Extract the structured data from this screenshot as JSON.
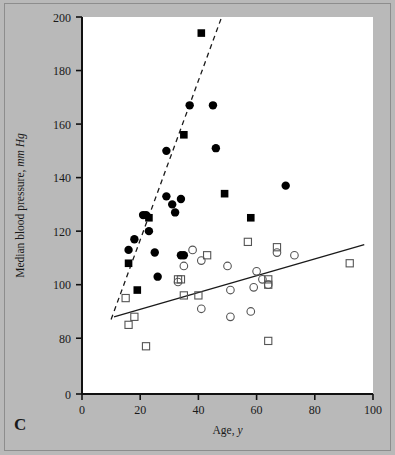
{
  "figure": {
    "panel_label": "C",
    "background_color": "#b9b9b9",
    "plot_background_color": "#ffffff"
  },
  "chart_data": {
    "type": "scatter",
    "title": "",
    "xlabel_plain": "Age, ",
    "xlabel_italic": "y",
    "ylabel_plain": "Median blood pressure, ",
    "ylabel_italic": "mm Hg",
    "xlim": [
      0,
      100
    ],
    "ylim": [
      70,
      200
    ],
    "xticks": [
      0,
      20,
      40,
      60,
      80,
      100
    ],
    "yticks": [
      0,
      80,
      100,
      120,
      140,
      160,
      180,
      200
    ],
    "ytick_labels": [
      "0",
      "80",
      "100",
      "120",
      "140",
      "160",
      "180",
      "200"
    ],
    "y_axis_break": true,
    "grid": false,
    "legend_position": "none",
    "series": [
      {
        "name": "filled-circle",
        "marker": "filled-circle",
        "color": "#000000",
        "points": [
          [
            16,
            113
          ],
          [
            18,
            117
          ],
          [
            21,
            126
          ],
          [
            22,
            126
          ],
          [
            23,
            120
          ],
          [
            25,
            112
          ],
          [
            29,
            150
          ],
          [
            29,
            133
          ],
          [
            31,
            130
          ],
          [
            32,
            127
          ],
          [
            34,
            132
          ],
          [
            34,
            111
          ],
          [
            35,
            111
          ],
          [
            37,
            167
          ],
          [
            45,
            167
          ],
          [
            46,
            151
          ],
          [
            26,
            103
          ],
          [
            70,
            137
          ]
        ]
      },
      {
        "name": "filled-square",
        "marker": "filled-square",
        "color": "#000000",
        "points": [
          [
            16,
            108
          ],
          [
            19,
            98
          ],
          [
            23,
            125
          ],
          [
            35,
            156
          ],
          [
            41,
            194
          ],
          [
            49,
            134
          ],
          [
            58,
            125
          ]
        ]
      },
      {
        "name": "open-circle",
        "marker": "open-circle",
        "color": "#555555",
        "points": [
          [
            33,
            101
          ],
          [
            35,
            107
          ],
          [
            38,
            113
          ],
          [
            41,
            109
          ],
          [
            41,
            91
          ],
          [
            50,
            107
          ],
          [
            51,
            98
          ],
          [
            51,
            88
          ],
          [
            58,
            90
          ],
          [
            59,
            99
          ],
          [
            60,
            105
          ],
          [
            64,
            100
          ],
          [
            67,
            112
          ],
          [
            73,
            111
          ],
          [
            62,
            102
          ]
        ]
      },
      {
        "name": "open-square",
        "marker": "open-square",
        "color": "#555555",
        "points": [
          [
            15,
            95
          ],
          [
            16,
            85
          ],
          [
            18,
            88
          ],
          [
            22,
            77
          ],
          [
            33,
            102
          ],
          [
            34,
            102
          ],
          [
            35,
            96
          ],
          [
            40,
            96
          ],
          [
            43,
            111
          ],
          [
            57,
            116
          ],
          [
            64,
            102
          ],
          [
            64,
            100
          ],
          [
            64,
            79
          ],
          [
            67,
            114
          ],
          [
            92,
            108
          ]
        ]
      }
    ],
    "lines": [
      {
        "name": "hypertensive-regression-line",
        "style": "dashed",
        "color": "#1a1a1a",
        "x_start": 10,
        "y_start": 87,
        "x_end": 48,
        "y_end": 200
      },
      {
        "name": "normotensive-regression-line",
        "style": "solid",
        "color": "#1a1a1a",
        "x_start": 11,
        "y_start": 88,
        "x_end": 97,
        "y_end": 115
      }
    ]
  }
}
